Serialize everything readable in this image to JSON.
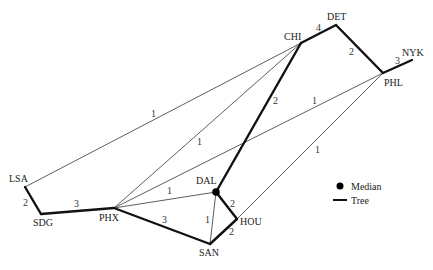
{
  "nodes": [
    {
      "id": "CHI",
      "label": "CHI",
      "x": 301,
      "y": 43,
      "lx": 284,
      "ly": 40
    },
    {
      "id": "DET",
      "label": "DET",
      "x": 336,
      "y": 25,
      "lx": 327,
      "ly": 20
    },
    {
      "id": "NYK",
      "label": "NYK",
      "x": 412,
      "y": 60,
      "lx": 402,
      "ly": 56
    },
    {
      "id": "PHL",
      "label": "PHL",
      "x": 383,
      "y": 73,
      "lx": 384,
      "ly": 86
    },
    {
      "id": "LSA",
      "label": "LSA",
      "x": 25,
      "y": 187,
      "lx": 9,
      "ly": 182
    },
    {
      "id": "SDG",
      "label": "SDG",
      "x": 41,
      "y": 214,
      "lx": 33,
      "ly": 226
    },
    {
      "id": "PHX",
      "label": "PHX",
      "x": 114,
      "y": 208,
      "lx": 99,
      "ly": 221
    },
    {
      "id": "DAL",
      "label": "DAL",
      "x": 216,
      "y": 192,
      "lx": 196,
      "ly": 184
    },
    {
      "id": "HOU",
      "label": "HOU",
      "x": 237,
      "y": 219,
      "lx": 240,
      "ly": 225
    },
    {
      "id": "SAN",
      "label": "SAN",
      "x": 210,
      "y": 244,
      "lx": 199,
      "ly": 256
    }
  ],
  "edges": [
    {
      "from": "CHI",
      "to": "DET",
      "weight": "4",
      "tree": true,
      "wx": 316,
      "wy": 31
    },
    {
      "from": "DET",
      "to": "PHL",
      "weight": "2",
      "tree": true,
      "wx": 349,
      "wy": 55
    },
    {
      "from": "PHL",
      "to": "NYK",
      "weight": "3",
      "tree": true,
      "wx": 395,
      "wy": 64
    },
    {
      "from": "CHI",
      "to": "DAL",
      "weight": "2",
      "tree": true,
      "wx": 273,
      "wy": 104
    },
    {
      "from": "DAL",
      "to": "HOU",
      "weight": "2",
      "tree": true,
      "wx": 230,
      "wy": 207
    },
    {
      "from": "HOU",
      "to": "SAN",
      "weight": "2",
      "tree": true,
      "wx": 229,
      "wy": 235
    },
    {
      "from": "SAN",
      "to": "PHX",
      "weight": "3",
      "tree": true,
      "wx": 162,
      "wy": 223
    },
    {
      "from": "PHX",
      "to": "SDG",
      "weight": "3",
      "tree": true,
      "wx": 74,
      "wy": 207
    },
    {
      "from": "SDG",
      "to": "LSA",
      "weight": "2",
      "tree": true,
      "wx": 23,
      "wy": 206
    },
    {
      "from": "LSA",
      "to": "CHI",
      "weight": "1",
      "tree": false,
      "wx": 151,
      "wy": 117
    },
    {
      "from": "PHX",
      "to": "CHI",
      "weight": "1",
      "tree": false,
      "wx": 197,
      "wy": 145
    },
    {
      "from": "PHX",
      "to": "PHL",
      "weight": "1",
      "tree": false,
      "wx": 312,
      "wy": 104
    },
    {
      "from": "PHX",
      "to": "DAL",
      "weight": "1",
      "tree": false,
      "wx": 167,
      "wy": 194
    },
    {
      "from": "SAN",
      "to": "DAL",
      "weight": "1",
      "tree": false,
      "wx": 205,
      "wy": 223
    },
    {
      "from": "HOU",
      "to": "PHL",
      "weight": "1",
      "tree": false,
      "wx": 315,
      "wy": 153
    }
  ],
  "median": {
    "node": "DAL"
  },
  "legend": {
    "median_label": "Median",
    "tree_label": "Tree"
  },
  "colors": {
    "tree_edge": "#111111",
    "other_edge": "#333333",
    "median_dot": "#000000"
  }
}
